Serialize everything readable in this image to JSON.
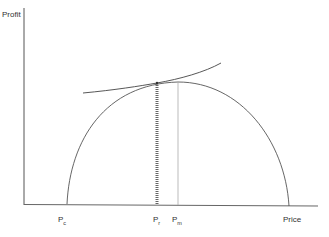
{
  "diagram": {
    "y_axis_label": "Profit",
    "x_axis_label": "Price",
    "ticks": [
      {
        "base": "P",
        "sub": "c"
      },
      {
        "base": "P",
        "sub": "r"
      },
      {
        "base": "P",
        "sub": "m"
      }
    ],
    "colors": {
      "axis": "#555555",
      "curve": "#555555",
      "dotted_line": "#666666",
      "pm_line": "#aaaaaa"
    }
  }
}
